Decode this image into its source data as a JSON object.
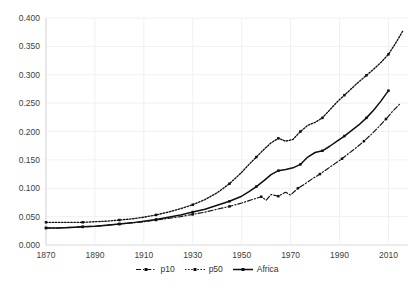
{
  "chart_data": {
    "type": "line",
    "title": "",
    "xlabel": "",
    "ylabel": "",
    "xlim": [
      1870,
      2018
    ],
    "ylim": [
      0.0,
      0.4
    ],
    "grid": true,
    "legend_position": "bottom-center",
    "xticks": [
      "1870",
      "1890",
      "1910",
      "1930",
      "1950",
      "1970",
      "1990",
      "2010"
    ],
    "xtick_values": [
      1870,
      1890,
      1910,
      1930,
      1950,
      1970,
      1990,
      2010
    ],
    "yticks": [
      "0.000",
      "0.050",
      "0.100",
      "0.150",
      "0.200",
      "0.250",
      "0.300",
      "0.350",
      "0.400"
    ],
    "ytick_values": [
      0.0,
      0.05,
      0.1,
      0.15,
      0.2,
      0.25,
      0.3,
      0.35,
      0.4
    ],
    "series": [
      {
        "name": "p10",
        "style": "dash-dot",
        "marker": "square",
        "color": "#101010",
        "x": [
          1870,
          1875,
          1880,
          1885,
          1890,
          1895,
          1900,
          1905,
          1910,
          1915,
          1920,
          1925,
          1930,
          1935,
          1940,
          1945,
          1950,
          1955,
          1958,
          1960,
          1962,
          1965,
          1968,
          1970,
          1973,
          1976,
          1979,
          1982,
          1985,
          1988,
          1991,
          1994,
          1997,
          2000,
          2003,
          2006,
          2009,
          2012,
          2015
        ],
        "values": [
          0.03,
          0.03,
          0.031,
          0.032,
          0.033,
          0.035,
          0.037,
          0.039,
          0.041,
          0.044,
          0.047,
          0.05,
          0.054,
          0.058,
          0.063,
          0.068,
          0.074,
          0.081,
          0.085,
          0.079,
          0.089,
          0.086,
          0.093,
          0.088,
          0.1,
          0.108,
          0.117,
          0.125,
          0.134,
          0.143,
          0.152,
          0.162,
          0.172,
          0.183,
          0.195,
          0.208,
          0.222,
          0.237,
          0.25
        ]
      },
      {
        "name": "p50",
        "style": "dotted",
        "marker": "square",
        "color": "#101010",
        "x": [
          1870,
          1875,
          1880,
          1885,
          1890,
          1895,
          1900,
          1905,
          1910,
          1915,
          1920,
          1925,
          1930,
          1935,
          1940,
          1945,
          1950,
          1953,
          1956,
          1959,
          1962,
          1965,
          1968,
          1971,
          1974,
          1977,
          1980,
          1983,
          1986,
          1989,
          1992,
          1995,
          1998,
          2001,
          2004,
          2007,
          2010,
          2013,
          2016
        ],
        "values": [
          0.04,
          0.04,
          0.04,
          0.04,
          0.041,
          0.042,
          0.044,
          0.046,
          0.049,
          0.053,
          0.058,
          0.064,
          0.071,
          0.08,
          0.092,
          0.108,
          0.128,
          0.142,
          0.155,
          0.168,
          0.18,
          0.188,
          0.183,
          0.186,
          0.2,
          0.211,
          0.216,
          0.224,
          0.238,
          0.252,
          0.264,
          0.276,
          0.288,
          0.299,
          0.31,
          0.322,
          0.336,
          0.356,
          0.378
        ]
      },
      {
        "name": "Africa",
        "style": "solid",
        "marker": "square",
        "color": "#101010",
        "x": [
          1870,
          1875,
          1880,
          1885,
          1890,
          1895,
          1900,
          1905,
          1910,
          1915,
          1920,
          1925,
          1930,
          1935,
          1940,
          1945,
          1950,
          1953,
          1956,
          1959,
          1962,
          1965,
          1968,
          1971,
          1974,
          1977,
          1980,
          1983,
          1986,
          1989,
          1992,
          1995,
          1998,
          2001,
          2004,
          2007,
          2010
        ],
        "values": [
          0.03,
          0.03,
          0.031,
          0.032,
          0.033,
          0.035,
          0.037,
          0.039,
          0.042,
          0.045,
          0.049,
          0.053,
          0.058,
          0.063,
          0.07,
          0.077,
          0.086,
          0.094,
          0.103,
          0.113,
          0.124,
          0.131,
          0.133,
          0.136,
          0.142,
          0.155,
          0.163,
          0.166,
          0.174,
          0.183,
          0.192,
          0.202,
          0.212,
          0.224,
          0.238,
          0.254,
          0.272
        ]
      }
    ]
  },
  "legend": {
    "items": [
      {
        "label": "p10"
      },
      {
        "label": "p50"
      },
      {
        "label": "Africa"
      }
    ]
  },
  "caption": {
    "text": ""
  }
}
